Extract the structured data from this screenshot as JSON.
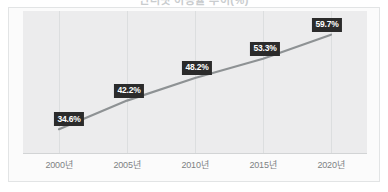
{
  "title": {
    "text": "인터넷 이용률 추이(%)",
    "cut_off": true
  },
  "chart_data": {
    "type": "line",
    "title": "인터넷 이용률 추이(%)",
    "xlabel": "",
    "ylabel": "",
    "categories": [
      "2000년",
      "2005년",
      "2010년",
      "2015년",
      "2020년"
    ],
    "values": [
      34.6,
      42.2,
      48.2,
      53.3,
      59.7
    ],
    "data_labels": [
      "34.6%",
      "42.2%",
      "48.2%",
      "53.3%",
      "59.7%"
    ],
    "ylim": [
      28,
      66
    ],
    "grid": "vertical-only",
    "legend": "none",
    "series": [
      {
        "name": "비율",
        "values": [
          34.6,
          42.2,
          48.2,
          53.3,
          59.7
        ]
      }
    ]
  },
  "style": {
    "line_color": "#8e9294",
    "label_box_bg": "#2b2b2b",
    "label_text_color": "#ffffff",
    "plot_bg": "#ececed",
    "frame_bg": "#fbfbfb",
    "frame_border": "#e2e4e5",
    "gridline_color": "#dcdedf",
    "tick_text_color": "#7d8183",
    "page_bg": "#ffffff"
  },
  "axis": {
    "tick_labels": [
      "2000년",
      "2005년",
      "2010년",
      "2015년",
      "2020년"
    ]
  }
}
